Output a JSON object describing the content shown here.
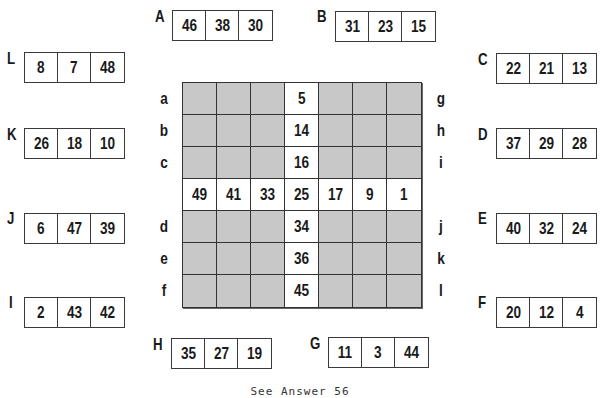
{
  "puzzle": {
    "grid": {
      "rows": 7,
      "cols": 7,
      "center_column_values": [
        "5",
        "14",
        "16",
        "25",
        "34",
        "36",
        "45"
      ],
      "middle_row_values": [
        "49",
        "41",
        "33",
        "25",
        "17",
        "9",
        "1"
      ],
      "left_row_labels": [
        "a",
        "b",
        "c",
        "",
        "d",
        "e",
        "f"
      ],
      "right_row_labels": [
        "g",
        "h",
        "i",
        "",
        "j",
        "k",
        "l"
      ],
      "shaded_color": "#c8c8c8",
      "open_color": "#ffffff"
    },
    "clues": {
      "A": {
        "letter": "A",
        "values": [
          "46",
          "38",
          "30"
        ]
      },
      "B": {
        "letter": "B",
        "values": [
          "31",
          "23",
          "15"
        ]
      },
      "C": {
        "letter": "C",
        "values": [
          "22",
          "21",
          "13"
        ]
      },
      "D": {
        "letter": "D",
        "values": [
          "37",
          "29",
          "28"
        ]
      },
      "E": {
        "letter": "E",
        "values": [
          "40",
          "32",
          "24"
        ]
      },
      "F": {
        "letter": "F",
        "values": [
          "20",
          "12",
          "4"
        ]
      },
      "G": {
        "letter": "G",
        "values": [
          "11",
          "3",
          "44"
        ]
      },
      "H": {
        "letter": "H",
        "values": [
          "35",
          "27",
          "19"
        ]
      },
      "I": {
        "letter": "I",
        "values": [
          "2",
          "43",
          "42"
        ]
      },
      "J": {
        "letter": "J",
        "values": [
          "6",
          "47",
          "39"
        ]
      },
      "K": {
        "letter": "K",
        "values": [
          "26",
          "18",
          "10"
        ]
      },
      "L": {
        "letter": "L",
        "values": [
          "8",
          "7",
          "48"
        ]
      }
    },
    "footer": "See Answer 56"
  }
}
